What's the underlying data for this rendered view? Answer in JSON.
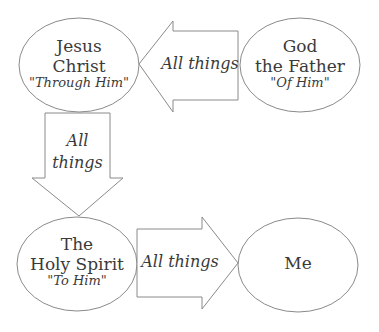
{
  "nodes": {
    "jesus": {
      "line1": "Jesus",
      "line2": "Christ",
      "sub": "\"Through Him\""
    },
    "father": {
      "line1": "God",
      "line2": "the Father",
      "sub": "\"Of Him\""
    },
    "spirit": {
      "line1": "The",
      "line2": "Holy Spirit",
      "sub": "\"To Him\""
    },
    "me": {
      "line1": "Me"
    }
  },
  "arrows": {
    "father_to_jesus": {
      "label": "All things",
      "direction": "left"
    },
    "jesus_to_spirit": {
      "line1": "All",
      "line2": "things",
      "direction": "down"
    },
    "spirit_to_me": {
      "label": "All things",
      "direction": "right"
    }
  },
  "colors": {
    "stroke": "#8a8a8a",
    "text": "#3a3a3a",
    "background": "#ffffff"
  }
}
